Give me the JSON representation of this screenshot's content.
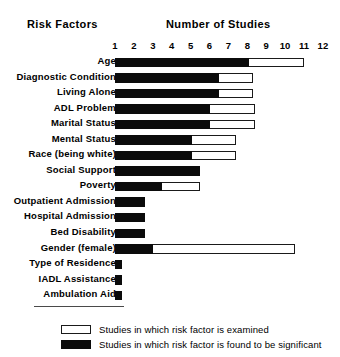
{
  "headings": {
    "left": "Risk Factors",
    "right": "Number of Studies"
  },
  "legend": {
    "examined": "Studies in which risk factor is examined",
    "significant": "Studies in which risk factor is found to be significant"
  },
  "chart_data": {
    "type": "bar",
    "orientation": "horizontal",
    "title": "Number of Studies",
    "xlabel": "Number of Studies",
    "ylabel": "Risk Factors",
    "xlim": [
      0,
      12.5
    ],
    "ticks": [
      1,
      2,
      3,
      4,
      5,
      6,
      7,
      8,
      9,
      10,
      11,
      12
    ],
    "grid": false,
    "legend_position": "bottom",
    "categories": [
      "Age",
      "Diagnostic Condition",
      "Living Alone",
      "ADL Problem",
      "Marital Status",
      "Mental Status",
      "Race (being white)",
      "Social Support",
      "Poverty",
      "Outpatient Admission",
      "Hospital Admission",
      "Bed Disability",
      "Gender (female)",
      "Type of Residence",
      "IADL Assistance",
      "Ambulation Aid"
    ],
    "series": [
      {
        "name": "Studies in which risk factor is examined",
        "style": "open",
        "color": "#ffffff",
        "values": [
          10.0,
          7.3,
          7.3,
          7.4,
          7.4,
          6.4,
          6.4,
          4.5,
          4.5,
          1.6,
          1.6,
          1.6,
          9.5,
          0.35,
          0.35,
          0.35
        ]
      },
      {
        "name": "Studies in which risk factor is found to be significant",
        "style": "solid",
        "color": "#0b0b0b",
        "values": [
          7.1,
          5.5,
          5.5,
          5.0,
          5.0,
          4.1,
          4.1,
          4.5,
          2.5,
          1.6,
          1.6,
          1.6,
          2.0,
          0.35,
          0.35,
          0.35
        ]
      }
    ]
  }
}
